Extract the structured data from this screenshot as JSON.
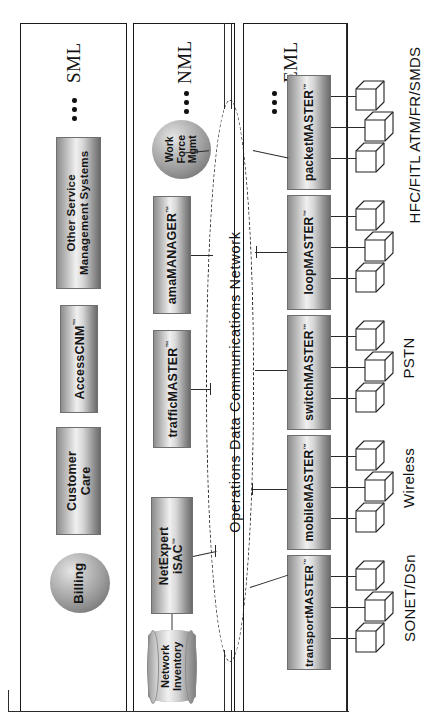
{
  "diagram": {
    "cloud_label": "Operations Data Communications Network",
    "ellipsis_glyph": "•"
  },
  "colors": {
    "box_dark": "#6b6b6b",
    "box_light": "#f0f0f0",
    "line": "#2b2b2b",
    "border": "#1a1a1a"
  },
  "layers": [
    {
      "id": "sml",
      "label": "SML",
      "nodes": [
        {
          "name": "Other Service Management Systems",
          "line1": "Other Service",
          "line2": "Management Systems",
          "shape": "box"
        },
        {
          "name": "AccessCNM",
          "line1": "AccessCNM",
          "trademark": "™",
          "shape": "box"
        },
        {
          "name": "Customer Care",
          "line1": "Customer",
          "line2": "Care",
          "shape": "box"
        },
        {
          "name": "Billing",
          "line1": "Billing",
          "shape": "sphere"
        }
      ]
    },
    {
      "id": "nml",
      "label": "NML",
      "nodes": [
        {
          "name": "Work Force Mgmt",
          "line1": "Work",
          "line2": "Force",
          "line3": "Mgmt",
          "shape": "sphere"
        },
        {
          "name": "amaMANAGER",
          "line1": "amaMANAGER",
          "trademark": "™",
          "shape": "box"
        },
        {
          "name": "trafficMASTER",
          "line1": "trafficMASTER",
          "trademark": "™",
          "shape": "box"
        },
        {
          "name": "NetExpert iSAC",
          "line1": "NetExpert",
          "line2": "iSAC",
          "trademark": "™",
          "shape": "box"
        },
        {
          "name": "Network Inventory",
          "line1": "Network",
          "line2": "Inventory",
          "shape": "cylinder"
        }
      ]
    },
    {
      "id": "eml",
      "label": "EML",
      "nodes": [
        {
          "name": "packetMASTER",
          "line1": "packetMASTER",
          "trademark": "™",
          "shape": "box"
        },
        {
          "name": "loopMASTER",
          "line1": "loopMASTER",
          "trademark": "™",
          "shape": "box"
        },
        {
          "name": "switchMASTER",
          "line1": "switchMASTER",
          "trademark": "™",
          "shape": "box"
        },
        {
          "name": "mobileMASTER",
          "line1": "mobileMASTER",
          "trademark": "™",
          "shape": "box"
        },
        {
          "name": "transportMASTER",
          "line1": "transportMASTER",
          "trademark": "™",
          "shape": "box"
        }
      ]
    }
  ],
  "network_labels": [
    {
      "id": "hfc",
      "text": "HFC/FITL ATM/FR/SMDS"
    },
    {
      "id": "pstn",
      "text": "PSTN"
    },
    {
      "id": "wireless",
      "text": "Wireless"
    },
    {
      "id": "sonet",
      "text": "SONET/DSn"
    }
  ]
}
